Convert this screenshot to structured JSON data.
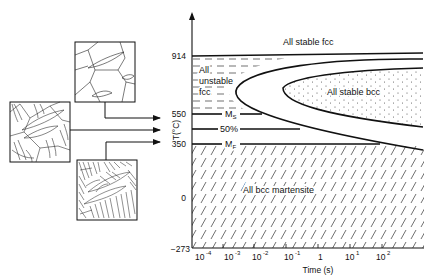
{
  "diagram": {
    "type": "TTT diagram (martensite transformation)",
    "y_axis": {
      "label": "T(°C)",
      "ticks": [
        "914",
        "550",
        "350",
        "0",
        "−273"
      ]
    },
    "x_axis": {
      "label": "Time (s)",
      "ticks": [
        "10",
        "10",
        "10",
        "10",
        "1",
        "10",
        "10"
      ],
      "exponents": [
        "-4",
        "-3",
        "-2",
        "-1",
        "",
        "1",
        "2"
      ]
    },
    "regions": {
      "stable_fcc": "All stable fcc",
      "unstable_fcc_line1": "All",
      "unstable_fcc_line2": "unstable",
      "unstable_fcc_line3": "fcc",
      "stable_bcc": "All stable bcc",
      "martensite": "All bcc martensite"
    },
    "lines": {
      "ms": "M",
      "ms_sub": "S",
      "fifty": "50%",
      "mf": "M",
      "mf_sub": "F"
    },
    "micrographs": [
      {
        "name": "unstable-fcc-micrograph",
        "target": "550"
      },
      {
        "name": "half-transformed-micrograph",
        "target": "50%"
      },
      {
        "name": "full-martensite-micrograph",
        "target": "350"
      }
    ]
  }
}
